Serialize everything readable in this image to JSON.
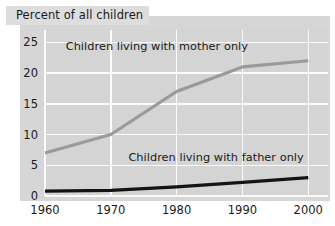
{
  "title": "Percent of all children",
  "chart_data": {
    "type": "line",
    "title": "Percent of all children",
    "xlabel": "",
    "ylabel": "",
    "x": [
      1960,
      1970,
      1980,
      1990,
      2000
    ],
    "xticklabels": [
      "1960",
      "1970",
      "1980",
      "1990",
      "2000"
    ],
    "yticklabels": [
      "0",
      "5",
      "10",
      "15",
      "20",
      "25"
    ],
    "yticks": [
      0,
      5,
      10,
      15,
      20,
      25
    ],
    "xlim": [
      1960,
      2003
    ],
    "ylim": [
      0,
      27
    ],
    "grid": true,
    "legend_position": "inline-annotation",
    "series": [
      {
        "name": "Children living with mother only",
        "label": "Children living with mother only",
        "color": "#9a9a9a",
        "values": [
          7,
          10,
          17,
          21,
          22
        ]
      },
      {
        "name": "Children living with father only",
        "label": "Children living with father only",
        "color": "#141414",
        "values": [
          0.8,
          0.9,
          1.5,
          2.2,
          3
        ]
      }
    ],
    "annotations": [
      {
        "text": "Children living with mother only",
        "x": 1977,
        "y": 24.2
      },
      {
        "text": "Children living with father only",
        "x": 1986,
        "y": 6.1
      }
    ]
  },
  "colors": {
    "panel": "#d6d6d6",
    "plot_bg": "#d4d4d4",
    "gridline": "#fbfbfb",
    "title_banner": "#dddddd",
    "text": "#1a1a1a",
    "mother_series": "#9a9a9a",
    "father_series": "#141414"
  }
}
